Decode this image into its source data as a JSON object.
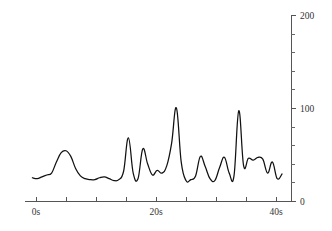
{
  "chart_data": {
    "type": "line",
    "title": "",
    "xlabel": "",
    "ylabel": "",
    "xlim": [
      -1.2,
      41.5
    ],
    "ylim": [
      0,
      200
    ],
    "grid": false,
    "legend": null,
    "series_name": "signal",
    "line_color": "#111111",
    "axis_color": "#555555",
    "x_tick_labels": [
      "0s",
      "20s",
      "40s"
    ],
    "x_tick_label_values": [
      0,
      20,
      40
    ],
    "x_ticks_all": [
      0,
      5,
      10,
      15,
      20,
      25,
      30,
      35,
      40
    ],
    "y_tick_labels": [
      "0",
      "100",
      "200"
    ],
    "y_tick_label_values": [
      0,
      100,
      200
    ],
    "y_ticks_all": [
      0,
      20,
      40,
      60,
      80,
      100,
      120,
      140,
      160,
      180,
      200
    ],
    "x": [
      -0.6,
      0.2,
      1.0,
      1.8,
      2.6,
      3.4,
      4.2,
      5.0,
      5.8,
      6.6,
      7.4,
      8.2,
      9.0,
      9.8,
      10.6,
      11.4,
      12.2,
      13.0,
      13.8,
      14.6,
      15.4,
      16.2,
      17.0,
      17.8,
      18.6,
      19.4,
      20.2,
      21.0,
      21.8,
      22.6,
      23.4,
      24.2,
      25.0,
      25.8,
      26.6,
      27.4,
      28.2,
      29.0,
      29.8,
      30.6,
      31.4,
      32.2,
      33.0,
      33.8,
      34.6,
      35.4,
      36.2,
      37.0,
      37.8,
      38.6,
      39.4,
      40.2,
      41.0
    ],
    "y": [
      25,
      24,
      26,
      28,
      30,
      42,
      52,
      54,
      48,
      35,
      27,
      24,
      23,
      23,
      25,
      26,
      24,
      22,
      23,
      32,
      68,
      30,
      24,
      56,
      40,
      28,
      33,
      30,
      38,
      62,
      100,
      42,
      22,
      23,
      27,
      48,
      37,
      24,
      22,
      36,
      47,
      30,
      27,
      97,
      38,
      46,
      44,
      47,
      45,
      30,
      42,
      24,
      29
    ]
  },
  "plot": {
    "left_px": 36,
    "right_px": 291,
    "baseline_px": 201,
    "top_px": 15
  }
}
